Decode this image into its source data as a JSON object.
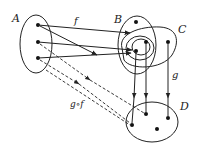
{
  "diagram": {
    "sets": [
      {
        "id": "A",
        "label": "A"
      },
      {
        "id": "B",
        "label": "B"
      },
      {
        "id": "C",
        "label": "C"
      },
      {
        "id": "D",
        "label": "D"
      }
    ],
    "mappings": [
      {
        "id": "f",
        "label": "f",
        "from": "A",
        "to": "B",
        "style": "solid"
      },
      {
        "id": "g",
        "label": "g",
        "from": "C",
        "to": "D",
        "style": "solid"
      },
      {
        "id": "gof",
        "label": "g∘f",
        "from": "A",
        "to": "D",
        "style": "dashed"
      }
    ],
    "colors": {
      "stroke": "#222222",
      "background": "#ffffff"
    }
  }
}
